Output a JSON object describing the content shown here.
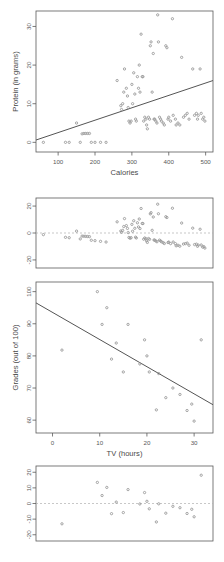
{
  "figure": {
    "width": 224,
    "height": 562,
    "background": "#ffffff",
    "panel_count": 4,
    "point_color": "#9a9a9a",
    "line_color": "#555555",
    "axis_color": "#5a5a5a",
    "zero_line_color": "#b0b0b0"
  },
  "chart_data": [
    {
      "id": "protein-vs-calories",
      "type": "scatter",
      "title": "",
      "xlabel": "Calories",
      "ylabel": "Protein (in grams)",
      "xlim": [
        40,
        520
      ],
      "ylim": [
        -2.5,
        34
      ],
      "xticks": [
        100,
        200,
        300,
        400,
        500
      ],
      "yticks": [
        0,
        10,
        20,
        30
      ],
      "grid": false,
      "legend": "none",
      "fit_line": {
        "type": "linear",
        "x": [
          40,
          520
        ],
        "y": [
          0.6,
          16.0
        ],
        "slope": 0.0321,
        "intercept": -0.68
      },
      "points": [
        [
          60,
          0
        ],
        [
          120,
          0
        ],
        [
          130,
          0
        ],
        [
          150,
          5
        ],
        [
          160,
          0
        ],
        [
          165,
          2.2
        ],
        [
          170,
          2.3
        ],
        [
          175,
          2.3
        ],
        [
          180,
          2.3
        ],
        [
          185,
          2.3
        ],
        [
          190,
          0
        ],
        [
          200,
          0
        ],
        [
          215,
          0
        ],
        [
          230,
          0
        ],
        [
          260,
          16
        ],
        [
          270,
          9.5
        ],
        [
          272,
          8.5
        ],
        [
          275,
          10
        ],
        [
          278,
          13
        ],
        [
          280,
          19
        ],
        [
          285,
          14
        ],
        [
          288,
          12
        ],
        [
          290,
          9
        ],
        [
          292,
          5.5
        ],
        [
          295,
          5
        ],
        [
          298,
          5.5
        ],
        [
          300,
          15
        ],
        [
          302,
          10
        ],
        [
          305,
          18
        ],
        [
          308,
          12.5
        ],
        [
          310,
          6
        ],
        [
          312,
          5.5
        ],
        [
          315,
          17
        ],
        [
          318,
          14
        ],
        [
          320,
          20
        ],
        [
          322,
          13
        ],
        [
          325,
          28
        ],
        [
          328,
          17
        ],
        [
          330,
          17
        ],
        [
          332,
          5.5
        ],
        [
          335,
          6.5
        ],
        [
          338,
          6
        ],
        [
          340,
          4.5
        ],
        [
          342,
          3.5
        ],
        [
          345,
          6.5
        ],
        [
          348,
          6
        ],
        [
          350,
          25
        ],
        [
          352,
          26
        ],
        [
          355,
          13
        ],
        [
          358,
          23
        ],
        [
          360,
          6
        ],
        [
          362,
          6
        ],
        [
          365,
          5.5
        ],
        [
          368,
          5
        ],
        [
          370,
          33
        ],
        [
          372,
          26
        ],
        [
          375,
          6.5
        ],
        [
          378,
          6
        ],
        [
          380,
          5.5
        ],
        [
          385,
          5
        ],
        [
          388,
          4.5
        ],
        [
          392,
          25
        ],
        [
          395,
          24.5
        ],
        [
          398,
          6
        ],
        [
          400,
          6.5
        ],
        [
          405,
          5.5
        ],
        [
          410,
          32
        ],
        [
          412,
          7
        ],
        [
          418,
          6
        ],
        [
          420,
          4.5
        ],
        [
          425,
          5
        ],
        [
          430,
          4.5
        ],
        [
          435,
          22
        ],
        [
          440,
          6.5
        ],
        [
          445,
          7
        ],
        [
          450,
          7.5
        ],
        [
          455,
          6
        ],
        [
          465,
          19
        ],
        [
          470,
          7
        ],
        [
          475,
          7.5
        ],
        [
          478,
          6
        ],
        [
          480,
          7
        ],
        [
          485,
          19
        ],
        [
          488,
          7.5
        ],
        [
          492,
          6
        ],
        [
          495,
          6.5
        ],
        [
          498,
          5.5
        ]
      ]
    },
    {
      "id": "protein-residuals",
      "type": "scatter",
      "title": "",
      "xlabel": "",
      "ylabel": "",
      "xlim": [
        40,
        520
      ],
      "ylim": [
        -26,
        26
      ],
      "xticks": [],
      "yticks": [
        20,
        0,
        -20
      ],
      "grid": false,
      "legend": "none",
      "zero_line": {
        "y": 0,
        "style": "dashed"
      },
      "points": [
        [
          60,
          -1.2
        ],
        [
          120,
          -3.2
        ],
        [
          130,
          -3.5
        ],
        [
          150,
          1.4
        ],
        [
          160,
          -4.4
        ],
        [
          165,
          -2.3
        ],
        [
          170,
          -2.4
        ],
        [
          175,
          -2.5
        ],
        [
          180,
          -2.6
        ],
        [
          185,
          -2.7
        ],
        [
          190,
          -5.4
        ],
        [
          200,
          -5.7
        ],
        [
          215,
          -6.2
        ],
        [
          230,
          -6.7
        ],
        [
          260,
          8.3
        ],
        [
          270,
          1.5
        ],
        [
          272,
          0.5
        ],
        [
          275,
          1.9
        ],
        [
          278,
          4.8
        ],
        [
          280,
          10.7
        ],
        [
          285,
          5.5
        ],
        [
          288,
          3.4
        ],
        [
          290,
          0.3
        ],
        [
          292,
          -3.3
        ],
        [
          295,
          -3.9
        ],
        [
          298,
          -3.5
        ],
        [
          300,
          6.4
        ],
        [
          302,
          1.3
        ],
        [
          305,
          9.1
        ],
        [
          308,
          3.5
        ],
        [
          310,
          -3.1
        ],
        [
          312,
          -3.7
        ],
        [
          315,
          7.6
        ],
        [
          318,
          4.5
        ],
        [
          320,
          10.4
        ],
        [
          322,
          3.3
        ],
        [
          325,
          18.2
        ],
        [
          328,
          7.1
        ],
        [
          330,
          7.0
        ],
        [
          332,
          -4.6
        ],
        [
          335,
          -3.7
        ],
        [
          338,
          -4.3
        ],
        [
          340,
          -5.9
        ],
        [
          342,
          -7.0
        ],
        [
          345,
          -4.1
        ],
        [
          348,
          -4.7
        ],
        [
          350,
          14.2
        ],
        [
          352,
          15.1
        ],
        [
          355,
          2.0
        ],
        [
          358,
          11.9
        ],
        [
          360,
          -5.2
        ],
        [
          362,
          -5.3
        ],
        [
          365,
          -5.9
        ],
        [
          368,
          -6.5
        ],
        [
          370,
          21.4
        ],
        [
          372,
          14.3
        ],
        [
          375,
          -5.3
        ],
        [
          378,
          -5.9
        ],
        [
          380,
          -6.5
        ],
        [
          385,
          -7.2
        ],
        [
          388,
          -7.8
        ],
        [
          392,
          12.1
        ],
        [
          395,
          11.5
        ],
        [
          398,
          -7.1
        ],
        [
          400,
          -6.7
        ],
        [
          405,
          -7.9
        ],
        [
          410,
          18.4
        ],
        [
          412,
          -6.7
        ],
        [
          418,
          -7.9
        ],
        [
          420,
          -9.5
        ],
        [
          425,
          -9.1
        ],
        [
          430,
          -9.8
        ],
        [
          435,
          7.4
        ],
        [
          440,
          -8.2
        ],
        [
          445,
          -7.9
        ],
        [
          450,
          -7.5
        ],
        [
          455,
          -9.1
        ],
        [
          465,
          3.6
        ],
        [
          470,
          -8.6
        ],
        [
          475,
          -8.3
        ],
        [
          478,
          -9.9
        ],
        [
          480,
          -9.0
        ],
        [
          485,
          2.8
        ],
        [
          488,
          -8.9
        ],
        [
          492,
          -10.5
        ],
        [
          495,
          -10.1
        ],
        [
          498,
          -11.2
        ]
      ]
    },
    {
      "id": "grades-vs-tv",
      "type": "scatter",
      "title": "",
      "xlabel": "TV (hours)",
      "ylabel": "Grades (out of 100)",
      "xlim": [
        -3.5,
        34
      ],
      "ylim": [
        56,
        103
      ],
      "xticks": [
        0,
        10,
        20,
        30
      ],
      "yticks": [
        60,
        70,
        80,
        90,
        100
      ],
      "grid": false,
      "legend": "none",
      "fit_line": {
        "type": "linear",
        "x": [
          -3.5,
          34
        ],
        "y": [
          96.5,
          64.8
        ],
        "slope": -0.845,
        "intercept": 93.54
      },
      "points": [
        [
          2.0,
          81.8
        ],
        [
          9.5,
          100.0
        ],
        [
          11.5,
          95.0
        ],
        [
          10.5,
          89.8
        ],
        [
          13.5,
          84.0
        ],
        [
          12.5,
          79.0
        ],
        [
          16.0,
          89.8
        ],
        [
          15.0,
          75.0
        ],
        [
          19.5,
          85.0
        ],
        [
          18.5,
          77.5
        ],
        [
          20.0,
          80.0
        ],
        [
          20.5,
          75.0
        ],
        [
          22.5,
          74.5
        ],
        [
          24.0,
          67.0
        ],
        [
          25.5,
          70.0
        ],
        [
          27.0,
          68.0
        ],
        [
          28.5,
          63.0
        ],
        [
          29.5,
          65.0
        ],
        [
          30.0,
          59.7
        ],
        [
          22.0,
          63.2
        ],
        [
          31.5,
          85.0
        ]
      ]
    },
    {
      "id": "grades-residuals",
      "type": "scatter",
      "title": "",
      "xlabel": "",
      "ylabel": "",
      "xlim": [
        -3.5,
        34
      ],
      "ylim": [
        -24,
        24
      ],
      "xticks": [],
      "yticks": [
        20,
        10,
        0,
        -10,
        -20
      ],
      "grid": false,
      "legend": "none",
      "zero_line": {
        "y": 0,
        "style": "dashed"
      },
      "points": [
        [
          2.0,
          -13.0
        ],
        [
          9.5,
          13.5
        ],
        [
          11.5,
          10.3
        ],
        [
          10.5,
          5.1
        ],
        [
          13.5,
          0.9
        ],
        [
          12.5,
          -6.5
        ],
        [
          16.0,
          8.9
        ],
        [
          15.0,
          -5.8
        ],
        [
          19.5,
          7.0
        ],
        [
          18.5,
          -0.3
        ],
        [
          20.0,
          1.4
        ],
        [
          20.5,
          -3.4
        ],
        [
          22.5,
          -0.2
        ],
        [
          24.0,
          -6.2
        ],
        [
          25.5,
          -1.8
        ],
        [
          27.0,
          -2.7
        ],
        [
          28.5,
          -6.4
        ],
        [
          29.5,
          -3.7
        ],
        [
          30.0,
          -8.5
        ],
        [
          22.0,
          -11.8
        ],
        [
          31.5,
          18.1
        ]
      ]
    }
  ],
  "panels": [
    {
      "name": "panel-protein-calories",
      "x": 0,
      "y": 6,
      "w": 224,
      "h": 178,
      "plot": {
        "left": 36,
        "top": 11,
        "right": 213,
        "bottom": 152
      }
    },
    {
      "name": "panel-protein-residuals",
      "x": 0,
      "y": 184,
      "w": 224,
      "h": 92,
      "plot": {
        "left": 36,
        "top": 198,
        "right": 213,
        "bottom": 268
      }
    },
    {
      "name": "panel-grades-tv",
      "x": 0,
      "y": 276,
      "w": 224,
      "h": 186,
      "plot": {
        "left": 36,
        "top": 282,
        "right": 213,
        "bottom": 433
      }
    },
    {
      "name": "panel-grades-residuals",
      "x": 0,
      "y": 462,
      "w": 224,
      "h": 100,
      "plot": {
        "left": 36,
        "top": 466,
        "right": 213,
        "bottom": 541
      }
    }
  ]
}
